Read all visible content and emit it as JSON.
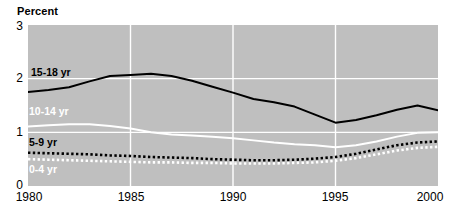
{
  "chart_data": {
    "type": "line",
    "title": "",
    "ylabel": "Percent",
    "xlabel": "",
    "ylim": [
      0,
      3
    ],
    "xlim": [
      1980,
      2000
    ],
    "yticks": [
      "0",
      "1",
      "2",
      "3"
    ],
    "xticks": [
      "1980",
      "1985",
      "1990",
      "1995",
      "2000"
    ],
    "grid": true,
    "legend_position": "inline-labels",
    "plot_background": "#bfbfbf",
    "gridline_color": "#ffffff",
    "series": [
      {
        "name": "15-18 yr",
        "label": "15-18 yr",
        "color": "#000000",
        "style": "solid",
        "label_color": "#000000",
        "x": [
          1980,
          1981,
          1982,
          1983,
          1984,
          1985,
          1986,
          1987,
          1988,
          1989,
          1990,
          1991,
          1992,
          1993,
          1994,
          1995,
          1996,
          1997,
          1998,
          1999,
          2000
        ],
        "values": [
          1.75,
          1.79,
          1.84,
          1.95,
          2.05,
          2.07,
          2.09,
          2.05,
          1.96,
          1.85,
          1.74,
          1.62,
          1.56,
          1.48,
          1.33,
          1.18,
          1.23,
          1.32,
          1.42,
          1.5,
          1.41
        ]
      },
      {
        "name": "10-14 yr",
        "label": "10-14 yr",
        "color": "#ffffff",
        "style": "solid",
        "label_color": "#ffffff",
        "x": [
          1980,
          1981,
          1982,
          1983,
          1984,
          1985,
          1986,
          1987,
          1988,
          1989,
          1990,
          1991,
          1992,
          1993,
          1994,
          1995,
          1996,
          1997,
          1998,
          1999,
          2000
        ],
        "values": [
          1.11,
          1.13,
          1.15,
          1.15,
          1.12,
          1.07,
          1.0,
          0.96,
          0.94,
          0.92,
          0.89,
          0.85,
          0.81,
          0.78,
          0.76,
          0.72,
          0.76,
          0.83,
          0.92,
          0.99,
          1.0
        ]
      },
      {
        "name": "5-9 yr",
        "label": "5-9 yr",
        "color": "#000000",
        "style": "dotted",
        "label_color": "#000000",
        "x": [
          1980,
          1981,
          1982,
          1983,
          1984,
          1985,
          1986,
          1987,
          1988,
          1989,
          1990,
          1991,
          1992,
          1993,
          1994,
          1995,
          1996,
          1997,
          1998,
          1999,
          2000
        ],
        "values": [
          0.62,
          0.61,
          0.6,
          0.59,
          0.57,
          0.56,
          0.54,
          0.53,
          0.52,
          0.5,
          0.49,
          0.48,
          0.48,
          0.49,
          0.51,
          0.54,
          0.6,
          0.68,
          0.76,
          0.81,
          0.83
        ]
      },
      {
        "name": "0-4 yr",
        "label": "0-4 yr",
        "color": "#ffffff",
        "style": "dotted",
        "label_color": "#ffffff",
        "x": [
          1980,
          1981,
          1982,
          1983,
          1984,
          1985,
          1986,
          1987,
          1988,
          1989,
          1990,
          1991,
          1992,
          1993,
          1994,
          1995,
          1996,
          1997,
          1998,
          1999,
          2000
        ],
        "values": [
          0.5,
          0.49,
          0.48,
          0.47,
          0.46,
          0.45,
          0.44,
          0.44,
          0.43,
          0.43,
          0.42,
          0.42,
          0.42,
          0.43,
          0.44,
          0.47,
          0.52,
          0.59,
          0.66,
          0.71,
          0.73
        ]
      }
    ],
    "series_label_positions": [
      {
        "name": "15-18 yr",
        "left": 31,
        "top": 66
      },
      {
        "name": "10-14 yr",
        "left": 29,
        "top": 105
      },
      {
        "name": "5-9 yr",
        "left": 29,
        "top": 136
      },
      {
        "name": "0-4 yr",
        "left": 29,
        "top": 163
      }
    ]
  }
}
